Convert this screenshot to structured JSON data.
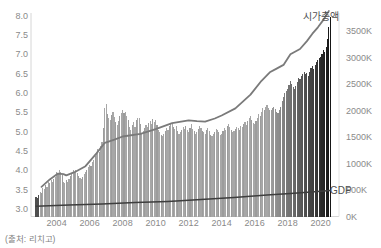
{
  "window": {
    "width": 381,
    "height": 248,
    "background": "#ffffff"
  },
  "source_note": "(출처: 리치고)",
  "chart_data": {
    "type": "combo-bar-line",
    "title": "",
    "x_unit": "month",
    "start_month": "2002-10",
    "end_month": "2020-08",
    "series_labels": {
      "market_cap": "시가총액",
      "gdp": "GDP"
    },
    "left_axis": {
      "min": 3.0,
      "max": 8.0,
      "ticks": [
        8.0,
        7.5,
        7.0,
        6.5,
        6.0,
        5.5,
        5.0,
        4.5,
        4.0,
        3.5,
        3.0
      ]
    },
    "right_axis": {
      "min": 0,
      "max": 3500,
      "suffix": "K",
      "ticks": [
        3500,
        3000,
        2500,
        2000,
        1500,
        1000,
        500,
        0
      ]
    },
    "x_tick_years": [
      2004,
      2006,
      2008,
      2010,
      2012,
      2014,
      2016,
      2018,
      2020
    ],
    "bars": {
      "axis": "left",
      "values": [
        3.3,
        3.28,
        3.35,
        3.45,
        3.42,
        3.55,
        3.52,
        3.62,
        3.58,
        3.7,
        3.66,
        3.74,
        3.7,
        3.78,
        3.82,
        3.95,
        3.9,
        4.0,
        3.96,
        3.88,
        3.7,
        3.66,
        3.74,
        3.7,
        3.78,
        3.85,
        3.92,
        4.0,
        3.96,
        4.02,
        3.92,
        3.85,
        3.8,
        3.78,
        3.84,
        3.9,
        3.96,
        4.02,
        4.08,
        4.15,
        4.1,
        4.22,
        4.28,
        4.38,
        4.46,
        4.55,
        4.48,
        4.62,
        4.72,
        5.1,
        5.6,
        5.72,
        5.45,
        5.35,
        5.3,
        5.42,
        5.5,
        5.38,
        5.25,
        5.18,
        5.28,
        5.4,
        5.48,
        5.55,
        5.48,
        5.52,
        5.4,
        5.3,
        5.12,
        5.05,
        5.18,
        5.25,
        5.12,
        5.3,
        5.36,
        5.35,
        5.2,
        4.95,
        5.02,
        5.1,
        5.18,
        5.12,
        5.22,
        5.28,
        5.2,
        5.32,
        5.25,
        5.3,
        5.18,
        5.05,
        4.98,
        4.92,
        4.88,
        4.95,
        5.02,
        5.1,
        5.05,
        5.15,
        5.22,
        5.2,
        5.12,
        5.08,
        5.15,
        5.02,
        4.95,
        4.98,
        5.05,
        5.12,
        5.08,
        5.15,
        5.05,
        5.0,
        5.1,
        5.2,
        5.08,
        5.02,
        4.95,
        5.0,
        5.08,
        5.15,
        5.1,
        5.02,
        4.98,
        4.95,
        5.05,
        5.1,
        5.02,
        4.92,
        4.88,
        4.95,
        5.0,
        5.08,
        5.05,
        4.98,
        4.92,
        4.95,
        5.02,
        5.1,
        5.05,
        5.15,
        5.2,
        5.12,
        5.05,
        4.98,
        5.02,
        5.08,
        5.12,
        5.1,
        5.05,
        5.15,
        5.12,
        5.2,
        5.25,
        5.18,
        5.28,
        5.35,
        5.4,
        5.3,
        5.22,
        5.2,
        5.28,
        5.35,
        5.45,
        5.4,
        5.52,
        5.6,
        5.55,
        5.65,
        5.7,
        5.62,
        5.55,
        5.55,
        5.6,
        5.65,
        5.58,
        5.52,
        5.48,
        5.55,
        5.65,
        5.8,
        5.9,
        6.0,
        6.05,
        6.1,
        6.2,
        6.3,
        6.22,
        6.15,
        6.1,
        6.18,
        6.28,
        6.4,
        6.35,
        6.45,
        6.5,
        6.55,
        6.48,
        6.52,
        6.45,
        6.55,
        6.65,
        6.7,
        6.62,
        6.72,
        6.8,
        6.85,
        6.9,
        6.92,
        7.0,
        7.1,
        7.05,
        7.2,
        7.4,
        7.7,
        7.97
      ]
    },
    "series": [
      {
        "name": "시가총액",
        "axis": "right",
        "points": [
          [
            4,
            560
          ],
          [
            10,
            700
          ],
          [
            16,
            810
          ],
          [
            20,
            800
          ],
          [
            22,
            775
          ],
          [
            28,
            835
          ],
          [
            36,
            950
          ],
          [
            44,
            1190
          ],
          [
            50,
            1390
          ],
          [
            57,
            1450
          ],
          [
            63,
            1510
          ],
          [
            76,
            1560
          ],
          [
            87,
            1650
          ],
          [
            99,
            1760
          ],
          [
            111,
            1815
          ],
          [
            117,
            1800
          ],
          [
            123,
            1790
          ],
          [
            130,
            1850
          ],
          [
            135,
            1905
          ],
          [
            145,
            2040
          ],
          [
            156,
            2300
          ],
          [
            164,
            2560
          ],
          [
            170,
            2720
          ],
          [
            175,
            2790
          ],
          [
            180,
            2860
          ],
          [
            185,
            3060
          ],
          [
            192,
            3160
          ],
          [
            197,
            3310
          ],
          [
            201,
            3450
          ],
          [
            205,
            3570
          ],
          [
            209,
            3710
          ],
          [
            213,
            3880
          ]
        ]
      },
      {
        "name": "GDP",
        "axis": "right",
        "points": [
          [
            0,
            192
          ],
          [
            24,
            215
          ],
          [
            48,
            238
          ],
          [
            72,
            262
          ],
          [
            96,
            285
          ],
          [
            120,
            320
          ],
          [
            144,
            358
          ],
          [
            168,
            405
          ],
          [
            185,
            434
          ],
          [
            200,
            462
          ],
          [
            214,
            490
          ]
        ]
      }
    ],
    "colors": {
      "bar_base": "#a7a7a7",
      "bar_alt": "#9c9c9c",
      "bar_first": "#4f4f4f",
      "bar_dark_end": "#161616",
      "ramp_start_index": 168,
      "market_cap_line": "#7a7a7a",
      "gdp_line": "#3e3e3e",
      "tick_text": "#8a8a8a",
      "annotation_text": "#4f4f4f",
      "source_text": "#7f7f7f",
      "spine": "#d6d6d6"
    },
    "legend_position": "inline-end-of-line",
    "grid": false
  }
}
